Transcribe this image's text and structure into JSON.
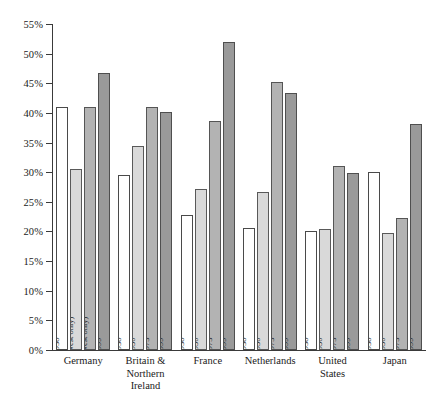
{
  "chart_data": {
    "type": "bar",
    "title": "",
    "subtitle": "",
    "xlabel": "",
    "ylabel": "",
    "ylim": [
      0,
      55
    ],
    "ytick_step": 5,
    "grid": false,
    "legend_position": "none",
    "yticks": [
      "55%",
      "50%",
      "45%",
      "40%",
      "35%",
      "30%",
      "25%",
      "20%",
      "15%",
      "10%",
      "5%",
      "0%"
    ],
    "ytick_values": [
      55,
      50,
      45,
      40,
      35,
      30,
      25,
      20,
      15,
      10,
      5,
      0
    ],
    "categories": [
      "Germany",
      "Britain & Northern Ireland",
      "France",
      "Netherlands",
      "United States",
      "Japan"
    ],
    "series": [
      {
        "name": "1938",
        "values": [
          41.0,
          29.6,
          22.7,
          20.6,
          20.0,
          30.0
        ]
      },
      {
        "name": "1950",
        "values": [
          30.5,
          34.5,
          27.1,
          26.6,
          20.5,
          19.8
        ]
      },
      {
        "name": "1973",
        "values": [
          41.0,
          41.0,
          38.7,
          45.3,
          31.0,
          22.3
        ]
      },
      {
        "name": "1999",
        "values": [
          46.7,
          40.2,
          51.9,
          43.4,
          29.8,
          38.2
        ]
      }
    ],
    "series_colors": [
      "#ffffff",
      "#d9d9d9",
      "#b3b3b3",
      "#9a9a9a"
    ],
    "bar_annotations": [
      [
        "1938",
        "1950 (West only)",
        "1973 (West only)",
        "1999"
      ],
      [
        "1938",
        "1950",
        "1973",
        "1999"
      ],
      [
        "1938",
        "1950",
        "1973",
        "1999"
      ],
      [
        "1938",
        "1950",
        "1973",
        "1999"
      ],
      [
        "1938",
        "1950",
        "1973",
        "1999"
      ],
      [
        "1938",
        "1950",
        "1973",
        "1999"
      ]
    ]
  },
  "axis": {
    "color": "#3a3a3a"
  }
}
